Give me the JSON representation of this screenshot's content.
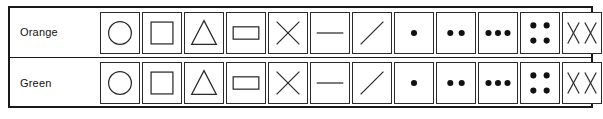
{
  "figure": {
    "name": "symbol-legend-table",
    "border_color": "#1a1a1a",
    "symbol_color": "#2a2a2a",
    "rows": [
      {
        "label": "Orange",
        "cells": [
          {
            "icon": "circle-icon"
          },
          {
            "icon": "square-icon"
          },
          {
            "icon": "triangle-icon"
          },
          {
            "icon": "rectangle-icon"
          },
          {
            "icon": "cross-x-icon"
          },
          {
            "icon": "horizontal-line-icon"
          },
          {
            "icon": "diagonal-line-icon"
          },
          {
            "icon": "one-dot-icon"
          },
          {
            "icon": "two-dots-icon"
          },
          {
            "icon": "three-dots-icon"
          },
          {
            "icon": "four-dots-icon"
          },
          {
            "icon": "double-x-icon",
            "text": "X X"
          }
        ]
      },
      {
        "label": "Green",
        "cells": [
          {
            "icon": "circle-icon"
          },
          {
            "icon": "square-icon"
          },
          {
            "icon": "triangle-icon"
          },
          {
            "icon": "rectangle-icon"
          },
          {
            "icon": "cross-x-icon"
          },
          {
            "icon": "horizontal-line-icon"
          },
          {
            "icon": "diagonal-line-icon"
          },
          {
            "icon": "one-dot-icon"
          },
          {
            "icon": "two-dots-icon"
          },
          {
            "icon": "three-dots-icon"
          },
          {
            "icon": "four-dots-icon"
          },
          {
            "icon": "double-x-icon",
            "text": "X X"
          }
        ]
      }
    ]
  }
}
